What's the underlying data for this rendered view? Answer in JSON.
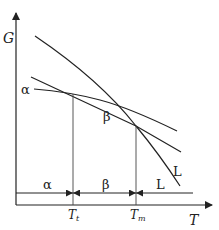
{
  "diagram": {
    "type": "free-energy vs temperature phase diagram",
    "y_axis_label": "G",
    "x_axis_label": "T",
    "curves": [
      {
        "name": "alpha",
        "label": "α"
      },
      {
        "name": "beta",
        "label": "β"
      },
      {
        "name": "liquid",
        "label": "L"
      }
    ],
    "transition_temperatures": [
      {
        "name": "transition",
        "label_main": "T",
        "label_sub": "t"
      },
      {
        "name": "melting",
        "label_main": "T",
        "label_sub": "m"
      }
    ],
    "stability_regions": [
      {
        "name": "alpha-region",
        "label": "α"
      },
      {
        "name": "beta-region",
        "label": "β"
      },
      {
        "name": "liquid-region",
        "label": "L"
      }
    ],
    "colors": {
      "line": "#222222",
      "background": "#ffffff"
    }
  }
}
